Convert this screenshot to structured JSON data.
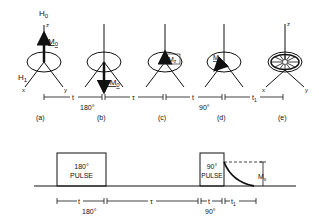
{
  "figure": {
    "axis_labels": {
      "H0": "H",
      "H0_sub": "0",
      "z": "z",
      "x": "x",
      "y": "y",
      "H1": "H",
      "H1_sub": "1"
    },
    "magnetization": {
      "a": {
        "label": "M",
        "sub": "0"
      },
      "b": {
        "label": "-M",
        "sub": "0"
      },
      "c": {
        "label": "M",
        "sub": "z"
      },
      "d": {
        "label": "M",
        "sub": "x"
      }
    },
    "panels": [
      "(a)",
      "(b)",
      "(c)",
      "(d)",
      "(e)"
    ],
    "top_timeline": {
      "t1": "t",
      "angle1": "180°",
      "tau": "τ",
      "t2": "t",
      "angle2": "90°",
      "t3": "t",
      "t3_sub": "1"
    },
    "pulses": [
      {
        "line1": "180°",
        "line2": "PULSE"
      },
      {
        "line1": "90°",
        "line2": "PULSE"
      }
    ],
    "signal_label": {
      "main": "M",
      "sub": "x"
    },
    "bottom_timeline": {
      "t1": "t",
      "angle1": "180°",
      "tau": "τ",
      "t2": "t",
      "angle2": "90°",
      "t3": "t",
      "t3_sub": "1"
    }
  }
}
